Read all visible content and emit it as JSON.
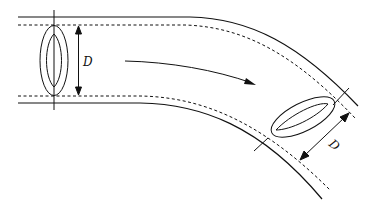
{
  "diagram": {
    "labels": {
      "left_diameter": "D",
      "right_diameter": "D"
    },
    "colors": {
      "stroke": "#111111",
      "background": "#ffffff"
    },
    "elements": {
      "pipe_outer_walls": "solid lines",
      "pipe_inner_walls": "dashed lines",
      "cross_sections": 2,
      "flow_direction": "left to right, curving downward"
    }
  }
}
